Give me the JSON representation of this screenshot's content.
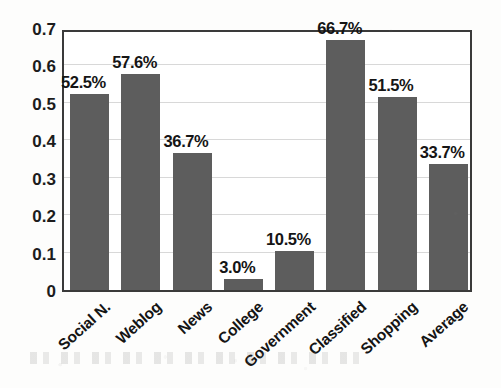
{
  "chart_data": {
    "type": "bar",
    "title": "",
    "subtitle": "",
    "xlabel": "",
    "ylabel": "",
    "categories": [
      "Social N.",
      "Weblog",
      "News",
      "College",
      "Government",
      "Classified",
      "Shopping",
      "Average"
    ],
    "values": [
      0.525,
      0.576,
      0.367,
      0.03,
      0.105,
      0.667,
      0.515,
      0.337
    ],
    "data_labels": [
      "52.5%",
      "57.6%",
      "36.7%",
      "3.0%",
      "10.5%",
      "66.7%",
      "51.5%",
      "33.7%"
    ],
    "ylim": [
      0,
      0.7
    ],
    "ytick_values": [
      0,
      0.1,
      0.2,
      0.3,
      0.4,
      0.5,
      0.6,
      0.7
    ],
    "ytick_labels": [
      "0",
      "0.1",
      "0.2",
      "0.3",
      "0.4",
      "0.5",
      "0.6",
      "0.7"
    ],
    "grid": true,
    "grid_axis": "y",
    "legend": false,
    "legend_position": "none",
    "series": [
      {
        "name": "",
        "values": [
          0.525,
          0.576,
          0.367,
          0.03,
          0.105,
          0.667,
          0.515,
          0.337
        ]
      }
    ],
    "annotations": [],
    "colors": {
      "bar_fill": "#5d5d5d",
      "plot_border": "#3a3a3a",
      "gridline": "#d8d8d8",
      "label_text": "#151515",
      "background": "#fdfdfc",
      "plot_background": "#ffffff"
    },
    "x_tick_label_rotation": -42
  }
}
